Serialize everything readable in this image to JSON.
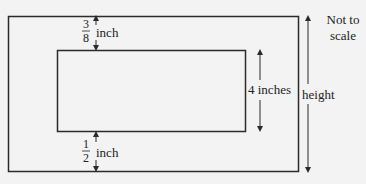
{
  "diagram": {
    "top_margin": {
      "numerator": "3",
      "denominator": "8",
      "unit": "inch"
    },
    "bottom_margin": {
      "numerator": "1",
      "denominator": "2",
      "unit": "inch"
    },
    "inner_height_label": "4 inches",
    "outer_height_label": "height",
    "note_line1": "Not to",
    "note_line2": "scale",
    "colors": {
      "stroke": "#2a2a2a",
      "background": "#f3f3f3"
    }
  }
}
